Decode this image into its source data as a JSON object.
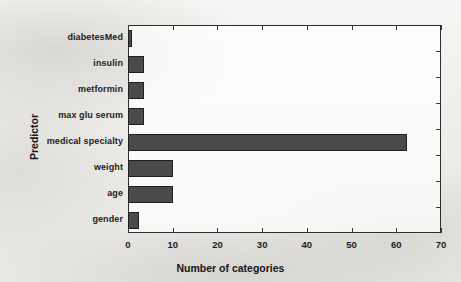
{
  "chart_data": {
    "type": "bar",
    "orientation": "horizontal",
    "title": "",
    "xlabel": "Number of categories",
    "ylabel": "Predictor",
    "categories": [
      "diabetesMed",
      "insulin",
      "metformin",
      "max glu serum",
      "medical specialty",
      "weight",
      "age",
      "gender"
    ],
    "values": [
      1,
      3.5,
      3.5,
      3.5,
      62.5,
      10,
      10,
      2.5
    ],
    "xlim": [
      0,
      70
    ],
    "ylim": [
      0,
      8
    ],
    "xticks": [
      0,
      10,
      20,
      30,
      40,
      50,
      60,
      70
    ],
    "xtick_labels": [
      "0",
      "10",
      "20",
      "30",
      "40",
      "50",
      "60",
      "70"
    ],
    "grid": false,
    "legend": null,
    "bar_color": "#4a4a4a",
    "bar_edge_color": "#1f1f1f",
    "background_color": "#f2f1ef",
    "axis_color": "#2e2e2e"
  }
}
